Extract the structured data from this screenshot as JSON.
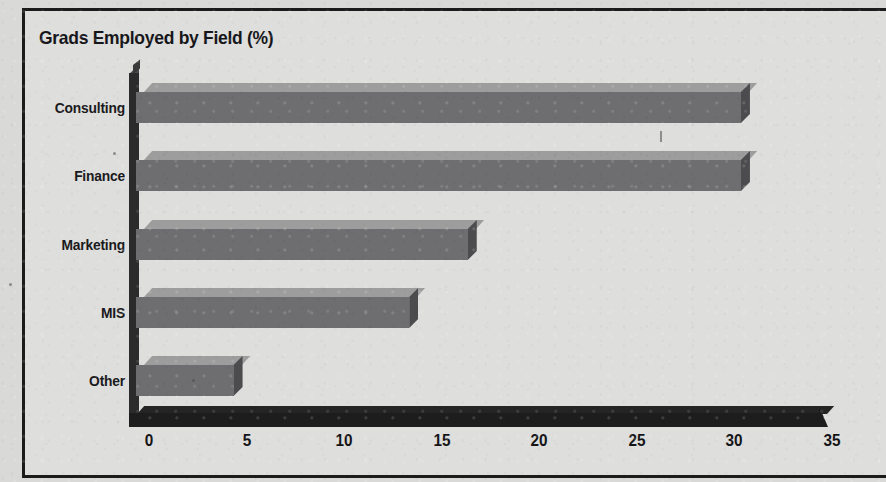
{
  "chart_data": {
    "type": "bar",
    "orientation": "horizontal",
    "title": "Grads Employed by Field (%)",
    "xlabel": "",
    "ylabel": "",
    "categories": [
      "Consulting",
      "Finance",
      "Marketing",
      "MIS",
      "Other"
    ],
    "values": [
      31,
      31,
      17,
      14,
      5
    ],
    "xlim": [
      0,
      35
    ],
    "xticks": [
      0,
      5,
      10,
      15,
      20,
      25,
      30,
      35
    ],
    "xtick_labels": [
      "0",
      "5",
      "10",
      "15",
      "20",
      "25",
      "30",
      "35"
    ],
    "grid": false,
    "legend": false,
    "style": "3d-shaded-bars",
    "colors": {
      "bar_front": "#6e6e70",
      "bar_top": "#9d9d9d",
      "bar_side": "#4c4c4e",
      "axis": "#1d1d1d",
      "text": "#16161a",
      "background": "#dededc",
      "frame": "#1b1b1b"
    }
  },
  "frame": {
    "title": "Grads Employed by Field (%)"
  }
}
